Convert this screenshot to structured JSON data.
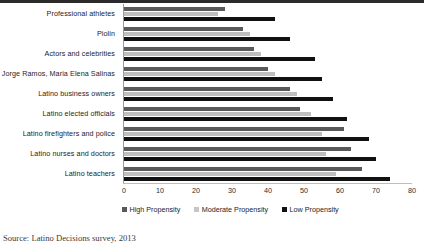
{
  "chart_data": {
    "type": "bar",
    "orientation": "horizontal",
    "title": "",
    "xlabel": "",
    "ylabel": "",
    "xlim": [
      0,
      80
    ],
    "xticks": [
      0,
      10,
      20,
      30,
      40,
      50,
      60,
      70,
      80
    ],
    "grid": false,
    "legend_position": "bottom",
    "categories": [
      "Professional athletes",
      "Piolin",
      "Actors and celebrities",
      "Jorge Ramos, Maria Elena Salinas",
      "Latino business owners",
      "Latino elected officials",
      "Latino firefighters and police",
      "Latino nurses and doctors",
      "Latino teachers"
    ],
    "series": [
      {
        "name": "High Propensity",
        "color": "#595959",
        "values": [
          28,
          33,
          36,
          40,
          46,
          49,
          61,
          63,
          66
        ]
      },
      {
        "name": "Moderate Propensity",
        "color": "#bfbfbf",
        "values": [
          26,
          35,
          38,
          42,
          48,
          52,
          55,
          56,
          59
        ]
      },
      {
        "name": "Low Propensity",
        "color": "#111111",
        "values": [
          42,
          46,
          53,
          55,
          58,
          62,
          68,
          70,
          74
        ]
      }
    ],
    "source_note": "Source: Latino Decisions survey, 2013"
  },
  "legend": {
    "items": [
      {
        "label": "High Propensity",
        "key": "high"
      },
      {
        "label": "Moderate Propensity",
        "key": "moderate"
      },
      {
        "label": "Low Propensity",
        "key": "low"
      }
    ]
  }
}
